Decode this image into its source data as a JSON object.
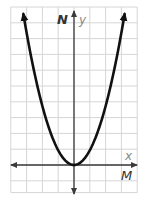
{
  "chart_data": {
    "type": "line",
    "title": "",
    "function": "y = k*x^2 (k > 0)",
    "vertex": [
      0,
      0
    ],
    "xlabel": "x",
    "ylabel": "y",
    "xaxis_name": "M",
    "yaxis_name": "N",
    "grid": true,
    "ticks_labeled": false,
    "x": [
      -3.2,
      -3,
      -2.5,
      -2,
      -1.5,
      -1,
      -0.5,
      0,
      0.5,
      1,
      1.5,
      2,
      2.5,
      3,
      3.2
    ],
    "series": [
      {
        "name": "parabola",
        "values": [
          9.5,
          8.4,
          5.8,
          3.7,
          2.1,
          0.9,
          0.2,
          0,
          0.2,
          0.9,
          2.1,
          3.7,
          5.8,
          8.4,
          9.5
        ]
      }
    ],
    "grid_cols_left_of_yaxis": 4,
    "grid_cols_right_of_yaxis": 4,
    "grid_rows_above_xaxis": 10,
    "grid_rows_below_xaxis": 2
  },
  "labels": {
    "y_axis_bold": "N",
    "y_axis_italic": "y",
    "x_axis_italic": "x",
    "x_axis_bold": "M"
  },
  "colors": {
    "grid": "#d6d6d6",
    "axis": "#3a3a3a",
    "curve": "#111111",
    "background": "#ffffff"
  }
}
